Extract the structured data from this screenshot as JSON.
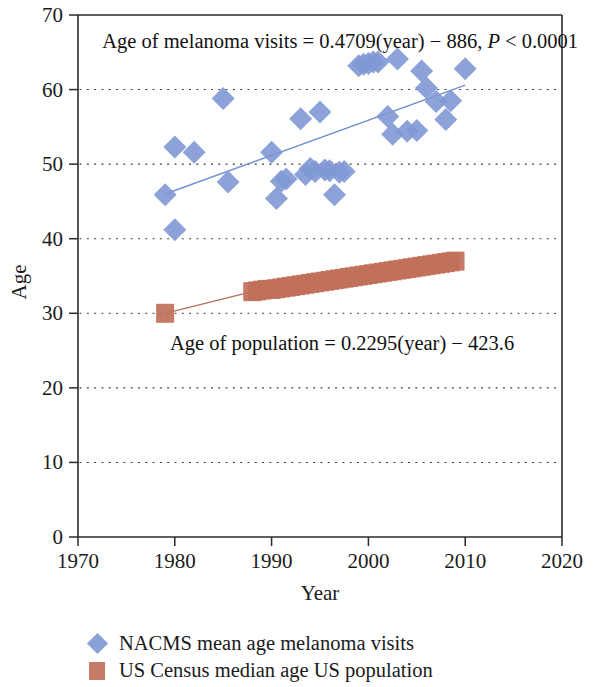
{
  "figure": {
    "background": "#ffffff"
  },
  "chart_data": {
    "type": "scatter",
    "title": "",
    "xlabel": "Year",
    "ylabel": "Age",
    "xlim": [
      1970,
      2020
    ],
    "ylim": [
      0,
      70
    ],
    "xticks": [
      1970,
      1980,
      1990,
      2000,
      2010,
      2020
    ],
    "yticks": [
      0,
      10,
      20,
      30,
      40,
      50,
      60,
      70
    ],
    "grid": "horizontal dotted at 10,20,30,40,50,60",
    "legend_position": "below axes, left aligned",
    "annotations": [
      {
        "name": "melanoma-regression-annotation",
        "text_plain": "Age of melanoma visits = 0.4709(year) − 886, P < 0.0001",
        "part1": "Age of melanoma visits = 0.4709(year) − 886, ",
        "part_italic": "P",
        "part2": " < 0.0001",
        "x": 1972.5,
        "y": 66.5
      },
      {
        "name": "population-regression-annotation",
        "text_plain": "Age of population = 0.2295(year) − 423.6",
        "x": 1979.5,
        "y": 26.0
      }
    ],
    "series": [
      {
        "name": "NACMS mean age melanoma visits",
        "marker": "diamond",
        "color": "#8098d4",
        "x": [
          1979,
          1980,
          1980,
          1982,
          1985,
          1985.5,
          1990,
          1990.5,
          1991,
          1991.5,
          1993,
          1993.5,
          1994,
          1994.5,
          1995,
          1995.5,
          1996,
          1996.5,
          1997,
          1997.5,
          1999,
          1999.5,
          2000,
          2000.5,
          2001,
          2002,
          2002.5,
          2003,
          2004,
          2005,
          2005.5,
          2006,
          2007,
          2008,
          2008.5,
          2010
        ],
        "y": [
          45.9,
          41.2,
          52.3,
          51.6,
          58.8,
          47.6,
          51.6,
          45.4,
          47.7,
          48.0,
          56.1,
          48.6,
          49.4,
          49.0,
          57.0,
          49.2,
          49.1,
          45.9,
          48.9,
          49.0,
          63.2,
          63.4,
          63.5,
          63.7,
          63.7,
          56.4,
          54.0,
          64.1,
          54.4,
          54.5,
          62.5,
          60.2,
          58.4,
          56.0,
          58.5,
          62.8
        ],
        "trendline": {
          "equation": "Age of melanoma visits = 0.4709(year) − 886",
          "slope": 0.4709,
          "intercept": -886,
          "p_value": "< 0.0001",
          "x_start": 1979,
          "x_end": 2010,
          "y_start": 46.0,
          "y_end": 60.6
        }
      },
      {
        "name": "US Census median age US population",
        "marker": "square",
        "color": "#c1705a",
        "x": [
          1979,
          1988,
          1988.5,
          1989,
          1989.5,
          1990,
          1990.5,
          1991,
          1991.5,
          1992,
          1992.5,
          1993,
          1993.5,
          1994,
          1994.5,
          1995,
          1995.5,
          1996,
          1996.5,
          1997,
          1997.5,
          1998,
          1998.5,
          1999,
          1999.5,
          2000,
          2000.5,
          2001,
          2001.5,
          2002,
          2002.5,
          2003,
          2003.5,
          2004,
          2004.5,
          2005,
          2005.5,
          2006,
          2006.5,
          2007,
          2007.5,
          2008,
          2008.5,
          2009
        ],
        "y": [
          30.0,
          32.9,
          33.0,
          33.1,
          33.2,
          33.2,
          33.3,
          33.4,
          33.5,
          33.6,
          33.7,
          33.8,
          33.9,
          34.0,
          34.1,
          34.2,
          34.3,
          34.4,
          34.5,
          34.6,
          34.7,
          34.8,
          34.9,
          35.0,
          35.1,
          35.2,
          35.3,
          35.4,
          35.5,
          35.6,
          35.7,
          35.8,
          35.9,
          36.0,
          36.1,
          36.2,
          36.3,
          36.4,
          36.5,
          36.6,
          36.7,
          36.8,
          36.9,
          37.0
        ],
        "trendline": {
          "equation": "Age of population = 0.2295(year) − 423.6",
          "slope": 0.2295,
          "intercept": -423.6,
          "x_start": 1979,
          "x_end": 1988,
          "y_start": 30.0,
          "y_end": 32.9
        }
      }
    ]
  },
  "legend": {
    "items": [
      {
        "marker": "diamond-marker",
        "color": "#8098d4",
        "label": "NACMS mean age melanoma visits"
      },
      {
        "marker": "square-marker",
        "color": "#c1705a",
        "label": "US Census median age US population"
      }
    ]
  }
}
